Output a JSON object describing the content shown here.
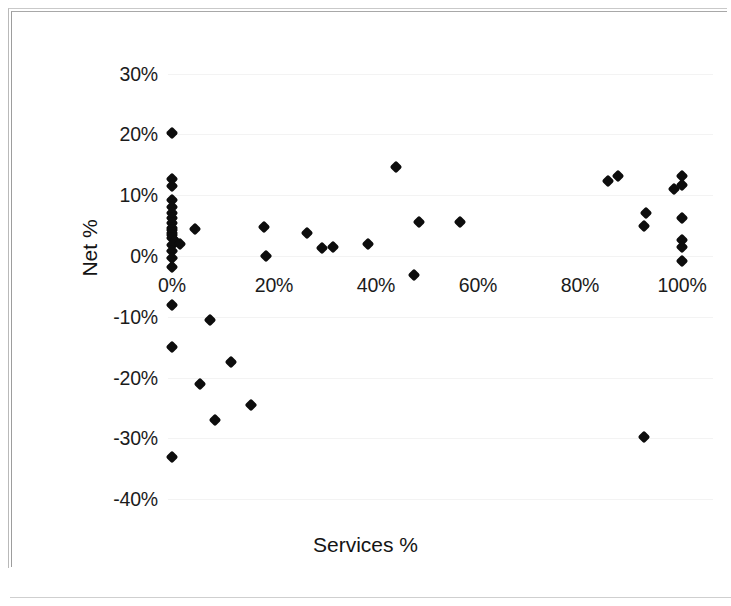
{
  "chart_data": {
    "type": "scatter",
    "title": "",
    "xlabel": "Services %",
    "ylabel": "Net %",
    "xlim": [
      -5,
      105
    ],
    "ylim": [
      -40,
      30
    ],
    "xticks": [
      "0%",
      "20%",
      "40%",
      "60%",
      "80%",
      "100%"
    ],
    "xtick_values": [
      0,
      20,
      40,
      60,
      80,
      100
    ],
    "yticks": [
      "30%",
      "20%",
      "10%",
      "0%",
      "-10%",
      "-20%",
      "-30%",
      "-40%"
    ],
    "ytick_values": [
      30,
      20,
      10,
      0,
      -10,
      -20,
      -30,
      -40
    ],
    "grid": false,
    "legend": null,
    "marker": "diamond",
    "marker_color": "#0d0d0d",
    "series": [
      {
        "name": "Firms",
        "points": [
          [
            0,
            20.3
          ],
          [
            0,
            12.6
          ],
          [
            0,
            11.5
          ],
          [
            0,
            9.2
          ],
          [
            0,
            8.0
          ],
          [
            0,
            7.0
          ],
          [
            0,
            6.2
          ],
          [
            0,
            5.4
          ],
          [
            0,
            4.6
          ],
          [
            0,
            4.2
          ],
          [
            0,
            3.8
          ],
          [
            0,
            3.4
          ],
          [
            0,
            2.9
          ],
          [
            0.5,
            2.4
          ],
          [
            0,
            1.8
          ],
          [
            1.5,
            2.0
          ],
          [
            0,
            0.8
          ],
          [
            0,
            -0.4
          ],
          [
            0,
            -1.8
          ],
          [
            4.5,
            4.4
          ],
          [
            0,
            -8.0
          ],
          [
            7.5,
            -10.5
          ],
          [
            0,
            -15.0
          ],
          [
            11.5,
            -17.5
          ],
          [
            5.5,
            -21.0
          ],
          [
            15.5,
            -24.5
          ],
          [
            8.5,
            -27.0
          ],
          [
            0,
            -33.0
          ],
          [
            18.0,
            4.8
          ],
          [
            18.5,
            0.0
          ],
          [
            26.5,
            3.8
          ],
          [
            29.5,
            1.3
          ],
          [
            31.5,
            1.4
          ],
          [
            38.5,
            1.9
          ],
          [
            44.0,
            14.6
          ],
          [
            47.5,
            -3.2
          ],
          [
            48.5,
            5.6
          ],
          [
            56.5,
            5.6
          ],
          [
            85.5,
            12.4
          ],
          [
            87.5,
            13.2
          ],
          [
            92.5,
            5.0
          ],
          [
            93.0,
            7.1
          ],
          [
            92.5,
            -29.7
          ],
          [
            98.5,
            11.0
          ],
          [
            100.0,
            13.2
          ],
          [
            100.0,
            11.6
          ],
          [
            100.0,
            6.2
          ],
          [
            100.0,
            2.7
          ],
          [
            100.0,
            1.4
          ],
          [
            100.0,
            -0.8
          ]
        ]
      }
    ]
  },
  "axes": {
    "x_title": "Services %",
    "y_title": "Net %"
  }
}
